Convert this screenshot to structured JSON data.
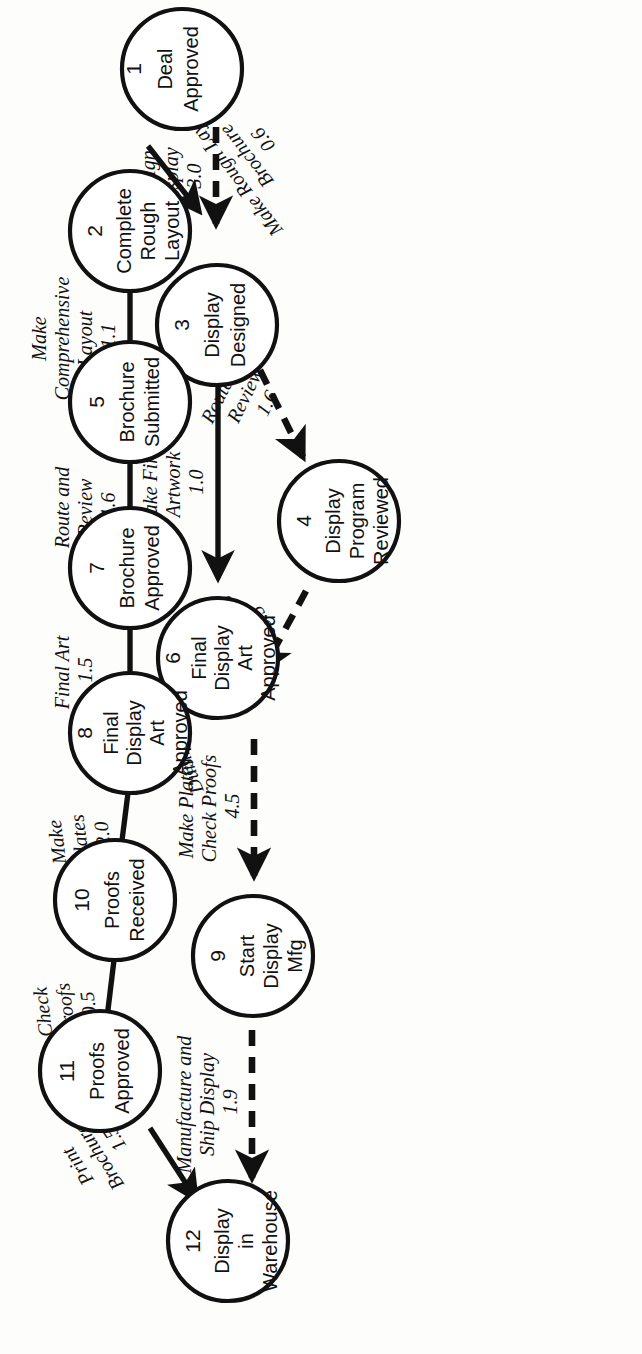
{
  "diagram": {
    "orientation": "rotated-90-ccw",
    "line_color": "#111111",
    "node_fill": "#ffffff",
    "background": "#fdfdfc"
  },
  "nodes": [
    {
      "id": "1",
      "num": "1",
      "lines": [
        "Deal",
        "Approved"
      ]
    },
    {
      "id": "2",
      "num": "2",
      "lines": [
        "Complete",
        "Rough",
        "Layout"
      ]
    },
    {
      "id": "3",
      "num": "3",
      "lines": [
        "Display",
        "Designed"
      ]
    },
    {
      "id": "4",
      "num": "4",
      "lines": [
        "Display",
        "Program",
        "Reviewed"
      ]
    },
    {
      "id": "5",
      "num": "5",
      "lines": [
        "Brochure",
        "Submitted"
      ]
    },
    {
      "id": "6",
      "num": "6",
      "lines": [
        "Final",
        "Display",
        "Art",
        "Approved"
      ]
    },
    {
      "id": "7",
      "num": "7",
      "lines": [
        "Brochure",
        "Approved"
      ]
    },
    {
      "id": "8",
      "num": "8",
      "lines": [
        "Final",
        "Display",
        "Art",
        "Approved"
      ]
    },
    {
      "id": "9",
      "num": "9",
      "lines": [
        "Start",
        "Display",
        "Mfg"
      ]
    },
    {
      "id": "10",
      "num": "10",
      "lines": [
        "Proofs",
        "Received"
      ]
    },
    {
      "id": "11",
      "num": "11",
      "lines": [
        "Proofs",
        "Approved"
      ]
    },
    {
      "id": "12",
      "num": "12",
      "lines": [
        "Display",
        "in",
        "Warehouse"
      ]
    }
  ],
  "edges": [
    {
      "from": "1",
      "to": "2",
      "style": "solid",
      "lines": [
        "Make Rough Layout",
        "Brochure"
      ],
      "duration": "0.6"
    },
    {
      "from": "2",
      "to": "5",
      "style": "solid",
      "lines": [
        "Make",
        "Comprehensive",
        "Layout"
      ],
      "duration": "1.1"
    },
    {
      "from": "5",
      "to": "7",
      "style": "solid",
      "lines": [
        "Route and",
        "Review"
      ],
      "duration": "1.6"
    },
    {
      "from": "7",
      "to": "8",
      "style": "solid",
      "lines": [
        "Final Art"
      ],
      "duration": "1.5"
    },
    {
      "from": "8",
      "to": "10",
      "style": "solid",
      "lines": [
        "Make",
        "Plates"
      ],
      "duration": "2.0"
    },
    {
      "from": "10",
      "to": "11",
      "style": "solid",
      "lines": [
        "Check",
        "Proofs"
      ],
      "duration": "0.5"
    },
    {
      "from": "11",
      "to": "12",
      "style": "solid",
      "lines": [
        "Print",
        "Brochures"
      ],
      "duration": "1.5"
    },
    {
      "from": "1",
      "to": "3",
      "style": "dashed",
      "lines": [
        "Design",
        "Display"
      ],
      "duration": "3.0"
    },
    {
      "from": "3",
      "to": "4",
      "style": "dashed",
      "lines": [
        "Route and",
        "Review"
      ],
      "duration": "1.6"
    },
    {
      "from": "4",
      "to": "6",
      "style": "dashed",
      "lines": [
        "Make",
        "Revisions"
      ],
      "duration": "0.5"
    },
    {
      "from": "3",
      "to": "6",
      "style": "solid",
      "lines": [
        "Make Final",
        "Artwork"
      ],
      "duration": "1.0"
    },
    {
      "from": "6",
      "to": "8",
      "style": "solid",
      "lines": [
        "Dummy"
      ],
      "duration": "0.0"
    },
    {
      "from": "6",
      "to": "9",
      "style": "dashed",
      "lines": [
        "Make Plates",
        "Check Proofs"
      ],
      "duration": "4.5"
    },
    {
      "from": "9",
      "to": "12",
      "style": "dashed",
      "lines": [
        "Manufacture and",
        "Ship Display"
      ],
      "duration": "1.9"
    }
  ]
}
